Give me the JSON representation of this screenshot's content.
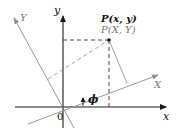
{
  "diagram": {
    "axes": {
      "x_label": "x",
      "y_label": "y",
      "X_label": "X",
      "Y_label": "Y",
      "origin_label": "0"
    },
    "point": {
      "label_xy": "P(x, y)",
      "label_XY": "P(X, Y)"
    },
    "angle_label": "ϕ",
    "colors": {
      "axis": "#1a1a1a",
      "rotated_axis": "#8c8c8c",
      "dashed": "#333333",
      "label_dark": "#111111",
      "label_gray": "#777777"
    }
  }
}
